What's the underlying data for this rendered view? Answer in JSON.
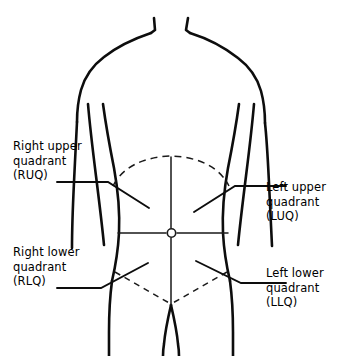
{
  "diagram": {
    "line_color": "#000000",
    "background_color": "#ffffff",
    "landmarks": {
      "umbilicus_label": "umbilicus",
      "vertical_midline_label": "median plane",
      "horizontal_line_label": "transumbilical plane",
      "costal_margin_label": "costal margin",
      "inguinal_line_label": "inguinal line"
    }
  },
  "labels": {
    "ruq": {
      "line1": "Right upper",
      "line2": "quadrant",
      "line3": "(RUQ)"
    },
    "luq": {
      "line1": "Left upper",
      "line2": "quadrant",
      "line3": "(LUQ)"
    },
    "rlq": {
      "line1": "Right lower",
      "line2": "quadrant",
      "line3": "(RLQ)"
    },
    "llq": {
      "line1": "Left lower",
      "line2": "quadrant",
      "line3": "(LLQ)"
    }
  }
}
